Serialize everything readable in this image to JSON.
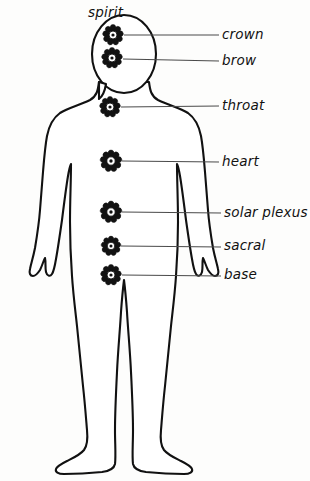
{
  "diagram": {
    "title": "spirit",
    "stroke_color": "#111111",
    "leader_color": "#4a4a4a",
    "background_color": "#fdfdfc",
    "top_label": {
      "text": "spirit",
      "x": 88,
      "y": 6
    },
    "chakras": [
      {
        "id": "crown",
        "label": "crown",
        "cx": 113,
        "cy": 35,
        "radius": 10,
        "petals": 9,
        "leader_from_x": 124,
        "leader_to_x": 219,
        "leader_y": 35,
        "label_x": 222,
        "label_y": 28
      },
      {
        "id": "brow",
        "label": "brow",
        "cx": 112,
        "cy": 58,
        "radius": 10,
        "petals": 9,
        "leader_from_x": 123,
        "leader_to_x": 219,
        "leader_y": 61,
        "label_x": 222,
        "label_y": 54
      },
      {
        "id": "throat",
        "label": "throat",
        "cx": 110,
        "cy": 107,
        "radius": 10,
        "petals": 9,
        "leader_from_x": 121,
        "leader_to_x": 219,
        "leader_y": 106,
        "label_x": 222,
        "label_y": 99
      },
      {
        "id": "heart",
        "label": "heart",
        "cx": 111,
        "cy": 161,
        "radius": 10.5,
        "petals": 9,
        "leader_from_x": 122,
        "leader_to_x": 219,
        "leader_y": 162,
        "label_x": 222,
        "label_y": 155
      },
      {
        "id": "solar-plexus",
        "label": "solar plexus",
        "cx": 111,
        "cy": 212,
        "radius": 10.5,
        "petals": 9,
        "leader_from_x": 122,
        "leader_to_x": 221,
        "leader_y": 213,
        "label_x": 224,
        "label_y": 206
      },
      {
        "id": "sacral",
        "label": "sacral",
        "cx": 111,
        "cy": 246,
        "radius": 9.5,
        "petals": 9,
        "leader_from_x": 121,
        "leader_to_x": 221,
        "leader_y": 247,
        "label_x": 224,
        "label_y": 239
      },
      {
        "id": "base",
        "label": "base",
        "cx": 111,
        "cy": 275,
        "radius": 10,
        "petals": 9,
        "leader_from_x": 122,
        "leader_to_x": 221,
        "leader_y": 276,
        "label_x": 224,
        "label_y": 268
      }
    ]
  }
}
